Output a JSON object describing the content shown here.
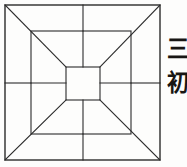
{
  "figure": {
    "stroke_color": "#2b2b2b",
    "background_color": "#fdfdfc",
    "line_width": 1,
    "outer_square": {
      "x": 5,
      "y": 5,
      "width": 155,
      "height": 155
    },
    "middle_square": {
      "x": 31,
      "y": 31,
      "width": 100,
      "height": 103
    },
    "inner_square": {
      "x": 66,
      "y": 67,
      "width": 34,
      "height": 33
    },
    "midlines": {
      "vertical_x": 83,
      "horizontal_y": 83
    },
    "diagonals": [
      {
        "name": "top-left",
        "from": [
          5,
          5
        ],
        "to": [
          66,
          67
        ]
      },
      {
        "name": "top-right",
        "from": [
          160,
          5
        ],
        "to": [
          100,
          67
        ]
      },
      {
        "name": "bottom-left",
        "from": [
          5,
          160
        ],
        "to": [
          66,
          100
        ]
      },
      {
        "name": "bottom-right",
        "from": [
          160,
          160
        ],
        "to": [
          100,
          100
        ]
      }
    ]
  },
  "annotation": {
    "characters": [
      "三",
      "初"
    ],
    "char_one": "三",
    "char_two": "初"
  }
}
